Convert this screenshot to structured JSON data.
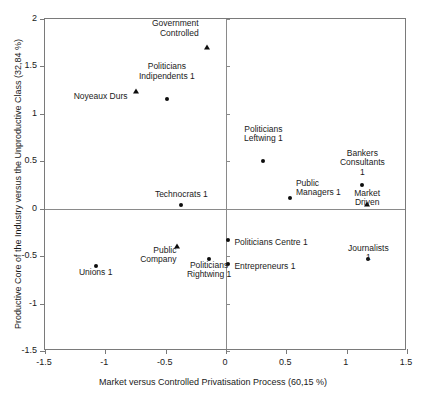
{
  "chart_data": {
    "type": "scatter",
    "title": "",
    "xlabel": "Market versus Controlled Privatisation Process (60,15 %)",
    "ylabel": "Productive Core of the Industry versus the Unproductive Class (32,84 %)",
    "xlim": [
      -1.5,
      1.5
    ],
    "ylim": [
      -1.5,
      2
    ],
    "xticks": [
      "-1.5",
      "-1",
      "-0.5",
      "0",
      "0.5",
      "1",
      "1.5"
    ],
    "xtick_values": [
      -1.5,
      -1,
      -0.5,
      0,
      0.5,
      1,
      1.5
    ],
    "yticks": [
      "2",
      "1.5",
      "1",
      "0.5",
      "0",
      "-0.5",
      "-1",
      "-1.5"
    ],
    "ytick_values": [
      2,
      1.5,
      1,
      0.5,
      0,
      -0.5,
      -1,
      -1.5
    ],
    "grid": false,
    "legend": "none",
    "origin_lines": true,
    "marker_color": "#0d0d0d",
    "frame_color": "#7a7a7a",
    "points": [
      {
        "label": "Government\nControlled",
        "x": -0.16,
        "y": 1.71,
        "marker": "triangle",
        "label_pos": "right",
        "dx": -8,
        "dy": -14
      },
      {
        "label": "Politicians\nIndipendents 1",
        "x": -0.49,
        "y": 1.16,
        "marker": "circle",
        "label_pos": "center",
        "dx": 0,
        "dy": -23
      },
      {
        "label": "Noyeaux Durs",
        "x": -0.75,
        "y": 1.24,
        "marker": "triangle",
        "label_pos": "right",
        "dx": -8,
        "dy": 5
      },
      {
        "label": "Politicians\nLeftwing 1",
        "x": 0.31,
        "y": 0.5,
        "marker": "circle",
        "label_pos": "center",
        "dx": 0,
        "dy": -23
      },
      {
        "label": "Bankers\nConsultants 1",
        "x": 1.13,
        "y": 0.25,
        "marker": "circle",
        "label_pos": "center",
        "dx": 0,
        "dy": -23
      },
      {
        "label": "Market Driven",
        "x": 1.17,
        "y": 0.05,
        "marker": "triangle",
        "label_pos": "center",
        "dx": 0,
        "dy": -11
      },
      {
        "label": "Public\nManagers 1",
        "x": 0.53,
        "y": 0.11,
        "marker": "circle",
        "label_pos": "left",
        "dx": 6,
        "dy": -6
      },
      {
        "label": "Technocrats 1",
        "x": -0.37,
        "y": 0.04,
        "marker": "circle",
        "label_pos": "center",
        "dx": 0,
        "dy": -11
      },
      {
        "label": "Public\nCompany",
        "x": -0.41,
        "y": -0.39,
        "marker": "triangle",
        "label_pos": "right",
        "dx": 0,
        "dy": 4
      },
      {
        "label": "Politicians\nRightwing 1",
        "x": -0.14,
        "y": -0.53,
        "marker": "circle",
        "label_pos": "center",
        "dx": 0,
        "dy": 6
      },
      {
        "label": "Politicians Centre 1",
        "x": 0.02,
        "y": -0.33,
        "marker": "circle",
        "label_pos": "left",
        "dx": 6,
        "dy": 2
      },
      {
        "label": "Entrepreneurs 1",
        "x": 0.02,
        "y": -0.58,
        "marker": "circle",
        "label_pos": "left",
        "dx": 6,
        "dy": 2
      },
      {
        "label": "Unions 1",
        "x": -1.08,
        "y": -0.6,
        "marker": "circle",
        "label_pos": "center",
        "dx": 0,
        "dy": 6
      },
      {
        "label": "Journalists 1",
        "x": 1.18,
        "y": -0.53,
        "marker": "circle",
        "label_pos": "center",
        "dx": 0,
        "dy": -11
      }
    ]
  }
}
